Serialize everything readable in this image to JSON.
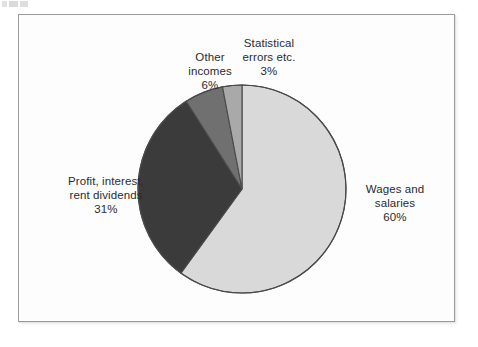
{
  "chart_data": {
    "type": "pie",
    "title": "",
    "subtitle": "",
    "xlabel": "",
    "ylabel": "",
    "legend_position": "none",
    "grid": false,
    "labels_show_percent": true,
    "start_angle_deg": 0,
    "direction": "clockwise",
    "categories": [
      "Wages and salaries",
      "Profit, interest, rent dividends",
      "Other incomes",
      "Statistical errors etc."
    ],
    "values": [
      60,
      31,
      6,
      3
    ],
    "unit": "%",
    "slices": [
      {
        "id": "wages",
        "name_line1": "Wages and",
        "name_line2": "salaries",
        "percent_label": "60%",
        "value": 60,
        "color": "#d9d9d9"
      },
      {
        "id": "profit",
        "name_line1": "Profit, interest,",
        "name_line2": "rent dividends",
        "percent_label": "31%",
        "value": 31,
        "color": "#3b3b3b"
      },
      {
        "id": "other-incomes",
        "name_line1": "Other",
        "name_line2": "incomes",
        "percent_label": "6%",
        "value": 6,
        "color": "#707070"
      },
      {
        "id": "statistical-errors",
        "name_line1": "Statistical",
        "name_line2": "errors etc.",
        "percent_label": "3%",
        "value": 3,
        "color": "#a9a9a9"
      }
    ],
    "colors": {
      "wages": "#d9d9d9",
      "profit": "#3b3b3b",
      "other_incomes": "#707070",
      "statistical_errors": "#a9a9a9",
      "slice_outline": "#4a4a4a",
      "frame_border": "#9a9a9a",
      "text": "#2b2b2b",
      "background": "#ffffff"
    }
  }
}
